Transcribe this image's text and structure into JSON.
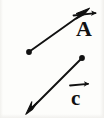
{
  "figure": {
    "background_color": "#fdfdfb",
    "ink_color": "#111111",
    "width": 104,
    "height": 118,
    "caption": "",
    "vectors": [
      {
        "id": "vector-a",
        "label": "A",
        "label_notation": "overhead-right-arrow",
        "tail_dot": true,
        "head_arrow": true,
        "direction": "up-right",
        "tail_x": 29,
        "tail_y": 52,
        "head_x": 88,
        "head_y": 10,
        "label_x": 77,
        "label_y": 22
      },
      {
        "id": "vector-c",
        "label": "c",
        "label_notation": "overhead-right-arrow",
        "tail_dot": true,
        "head_arrow": true,
        "direction": "down-left",
        "tail_x": 82,
        "tail_y": 58,
        "head_x": 27,
        "head_y": 113,
        "label_x": 71,
        "label_y": 92
      }
    ]
  }
}
